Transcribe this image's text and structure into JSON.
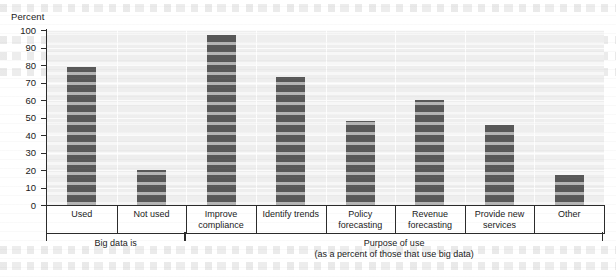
{
  "chart_data": {
    "type": "bar",
    "title": "",
    "ylabel": "Percent",
    "xlabel": "",
    "ylim": [
      0,
      100
    ],
    "yticks": [
      0,
      10,
      20,
      30,
      40,
      50,
      60,
      70,
      80,
      90,
      100
    ],
    "grid": true,
    "legend": "none",
    "bar_color": "#585858",
    "plot_background": "#eeeeee",
    "axis_color": "#2b2b2b",
    "categories": [
      "Used",
      "Not used",
      "Improve compliance",
      "Identify trends",
      "Policy forecasting",
      "Revenue forecasting",
      "Provide new services",
      "Other"
    ],
    "category_lines": [
      [
        "Used"
      ],
      [
        "Not used"
      ],
      [
        "Improve",
        "compliance"
      ],
      [
        "Identify trends"
      ],
      [
        "Policy forecasting"
      ],
      [
        "Revenue",
        "forecasting"
      ],
      [
        "Provide new",
        "services"
      ],
      [
        "Other"
      ]
    ],
    "values": [
      79,
      20,
      97,
      73,
      48,
      60,
      46,
      17
    ],
    "groups": [
      {
        "label": "Big data is",
        "sublabel": "",
        "span": 2
      },
      {
        "label": "Purpose of use",
        "sublabel": "(as a percent of those that use big data)",
        "span": 6
      }
    ]
  }
}
